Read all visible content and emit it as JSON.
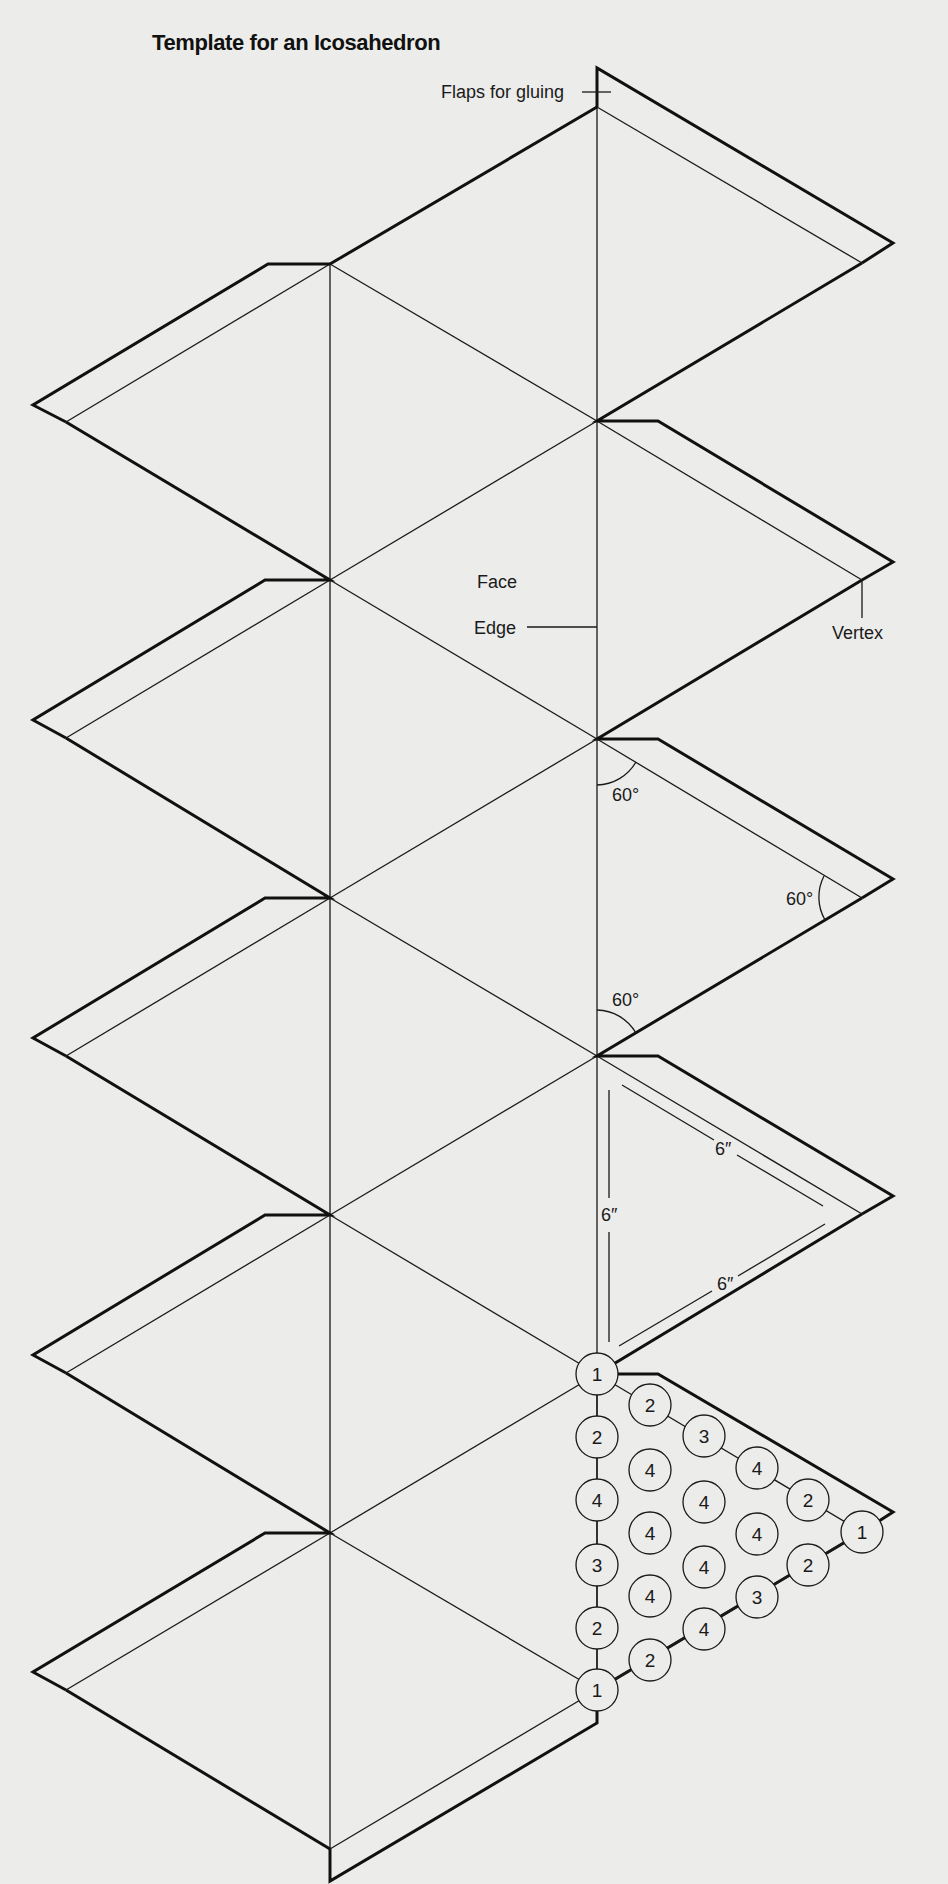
{
  "title": "Template for an Icosahedron",
  "labels": {
    "flaps": "Flaps for gluing",
    "face": "Face",
    "edge": "Edge",
    "vertex": "Vertex"
  },
  "angles": [
    "60°",
    "60°",
    "60°"
  ],
  "dimensions": [
    "6″",
    "6″",
    "6″"
  ],
  "gluing_order": {
    "left_column": [
      "1",
      "2",
      "4",
      "3",
      "2",
      "1"
    ],
    "top_diagonal": [
      "1",
      "2",
      "3",
      "4",
      "2",
      "1"
    ],
    "bottom_diagonal": [
      "1",
      "2",
      "4",
      "3",
      "2",
      "1"
    ],
    "interior": [
      "4",
      "4",
      "4",
      "4",
      "4",
      "4"
    ]
  },
  "colors": {
    "paper": "#ececea",
    "ink": "#1a1a1a"
  }
}
